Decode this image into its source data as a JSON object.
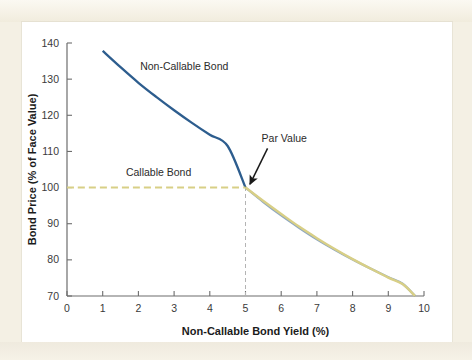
{
  "figure": {
    "background_color": "#f4f0e4",
    "panel_color": "#ffffff"
  },
  "chart_data": {
    "type": "line",
    "title": "",
    "xlabel": "Non-Callable Bond Yield (%)",
    "ylabel": "Bond Price (% of Face Value)",
    "xlim": [
      0,
      10
    ],
    "ylim": [
      70,
      140
    ],
    "xticks": [
      0,
      1,
      2,
      3,
      4,
      5,
      6,
      7,
      8,
      9,
      10
    ],
    "xtick_labels": [
      "0",
      "1",
      "2",
      "3",
      "4",
      "5",
      "6",
      "7",
      "8",
      "9",
      "10"
    ],
    "yticks": [
      70,
      80,
      90,
      100,
      110,
      120,
      130,
      140
    ],
    "ytick_labels": [
      "70",
      "80",
      "90",
      "100",
      "110",
      "120",
      "130",
      "140"
    ],
    "grid": false,
    "legend_position": "inline-labels",
    "series": [
      {
        "name": "Non-Callable Bond",
        "color": "#2d5d8e",
        "style": "solid",
        "label_text": "Non-Callable Bond",
        "label_x": 2.05,
        "label_y": 132.5,
        "x": [
          1.0,
          1.5,
          2.0,
          2.5,
          3.0,
          3.5,
          4.0,
          4.5,
          5.0,
          5.5,
          6.0,
          6.5,
          7.0,
          7.5,
          8.0,
          8.5,
          9.0,
          9.4,
          9.75
        ],
        "y": [
          137.8,
          133.3,
          129.0,
          125.1,
          121.4,
          117.9,
          114.6,
          111.5,
          100.0,
          96.0,
          92.3,
          88.9,
          85.7,
          82.8,
          80.1,
          77.6,
          75.2,
          73.4,
          70.0
        ]
      },
      {
        "name": "Callable Bond",
        "color": "#d8cf86",
        "style": "dashed-then-solid",
        "label_text": "Callable Bond",
        "label_x": 1.65,
        "label_y": 103.2,
        "dashed_x": [
          0.0,
          5.0
        ],
        "dashed_y": [
          100.0,
          100.0
        ],
        "x": [
          5.0,
          5.5,
          6.0,
          6.5,
          7.0,
          7.5,
          8.0,
          8.5,
          9.0,
          9.4,
          9.75
        ],
        "y": [
          100.0,
          96.3,
          92.7,
          89.2,
          86.0,
          83.0,
          80.2,
          77.6,
          75.1,
          73.3,
          70.0
        ]
      }
    ],
    "annotations": [
      {
        "text": "Par Value",
        "text_x": 5.45,
        "text_y": 112.5,
        "point_x": 5.0,
        "point_y": 100.0,
        "arrow_color": "#1a1a1a"
      }
    ],
    "guide_lines": [
      {
        "name": "par-value-dropline",
        "orientation": "vertical",
        "x": 5.0,
        "y_from": 70,
        "y_to": 100,
        "style": "dashed",
        "color": "#b4b4b4"
      }
    ]
  }
}
